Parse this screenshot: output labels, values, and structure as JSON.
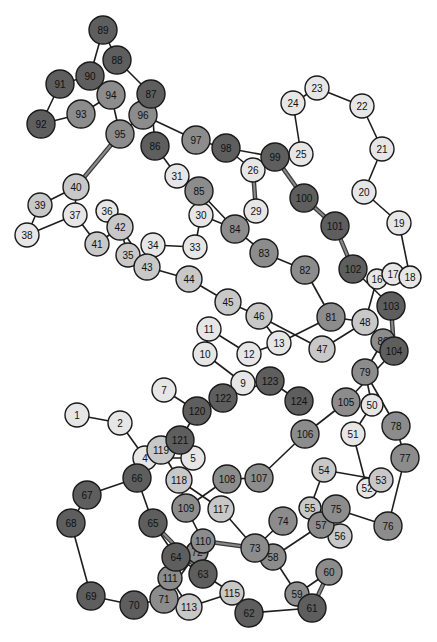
{
  "diagram": {
    "title": "",
    "shades": {
      "dark": "#5e5e5e",
      "medium": "#8c8c8c",
      "light": "#c8c8c8",
      "pale": "#e6e6e6"
    },
    "nodes": [
      {
        "id": "1",
        "x": 77,
        "y": 415,
        "r": 12,
        "shade": "pale"
      },
      {
        "id": "2",
        "x": 120,
        "y": 423,
        "r": 12,
        "shade": "pale"
      },
      {
        "id": "4",
        "x": 145,
        "y": 458,
        "r": 12,
        "shade": "pale"
      },
      {
        "id": "5",
        "x": 193,
        "y": 458,
        "r": 12,
        "shade": "pale"
      },
      {
        "id": "7",
        "x": 164,
        "y": 390,
        "r": 12,
        "shade": "pale"
      },
      {
        "id": "9",
        "x": 243,
        "y": 383,
        "r": 12,
        "shade": "pale"
      },
      {
        "id": "10",
        "x": 205,
        "y": 354,
        "r": 12,
        "shade": "pale"
      },
      {
        "id": "11",
        "x": 209,
        "y": 329,
        "r": 12,
        "shade": "pale"
      },
      {
        "id": "12",
        "x": 249,
        "y": 354,
        "r": 12,
        "shade": "pale"
      },
      {
        "id": "13",
        "x": 279,
        "y": 343,
        "r": 12,
        "shade": "pale"
      },
      {
        "id": "16",
        "x": 377,
        "y": 279,
        "r": 10,
        "shade": "pale"
      },
      {
        "id": "17",
        "x": 393,
        "y": 274,
        "r": 11,
        "shade": "pale"
      },
      {
        "id": "18",
        "x": 410,
        "y": 277,
        "r": 11,
        "shade": "pale"
      },
      {
        "id": "19",
        "x": 399,
        "y": 223,
        "r": 12,
        "shade": "pale"
      },
      {
        "id": "20",
        "x": 364,
        "y": 192,
        "r": 12,
        "shade": "pale"
      },
      {
        "id": "21",
        "x": 382,
        "y": 149,
        "r": 12,
        "shade": "pale"
      },
      {
        "id": "22",
        "x": 362,
        "y": 106,
        "r": 12,
        "shade": "pale"
      },
      {
        "id": "23",
        "x": 317,
        "y": 88,
        "r": 12,
        "shade": "pale"
      },
      {
        "id": "24",
        "x": 293,
        "y": 103,
        "r": 12,
        "shade": "pale"
      },
      {
        "id": "25",
        "x": 301,
        "y": 154,
        "r": 12,
        "shade": "pale"
      },
      {
        "id": "26",
        "x": 253,
        "y": 170,
        "r": 12,
        "shade": "pale"
      },
      {
        "id": "29",
        "x": 256,
        "y": 211,
        "r": 12,
        "shade": "pale"
      },
      {
        "id": "30",
        "x": 201,
        "y": 215,
        "r": 12,
        "shade": "pale"
      },
      {
        "id": "31",
        "x": 177,
        "y": 176,
        "r": 12,
        "shade": "pale"
      },
      {
        "id": "33",
        "x": 195,
        "y": 247,
        "r": 12,
        "shade": "pale"
      },
      {
        "id": "34",
        "x": 153,
        "y": 245,
        "r": 12,
        "shade": "pale"
      },
      {
        "id": "35",
        "x": 128,
        "y": 255,
        "r": 12,
        "shade": "light"
      },
      {
        "id": "36",
        "x": 107,
        "y": 211,
        "r": 11,
        "shade": "pale"
      },
      {
        "id": "37",
        "x": 75,
        "y": 215,
        "r": 12,
        "shade": "pale"
      },
      {
        "id": "38",
        "x": 27,
        "y": 235,
        "r": 12,
        "shade": "pale"
      },
      {
        "id": "39",
        "x": 40,
        "y": 205,
        "r": 12,
        "shade": "light"
      },
      {
        "id": "40",
        "x": 76,
        "y": 187,
        "r": 13,
        "shade": "light"
      },
      {
        "id": "41",
        "x": 97,
        "y": 244,
        "r": 12,
        "shade": "light"
      },
      {
        "id": "42",
        "x": 120,
        "y": 227,
        "r": 13,
        "shade": "light"
      },
      {
        "id": "43",
        "x": 147,
        "y": 267,
        "r": 13,
        "shade": "light"
      },
      {
        "id": "44",
        "x": 189,
        "y": 279,
        "r": 13,
        "shade": "light"
      },
      {
        "id": "45",
        "x": 228,
        "y": 302,
        "r": 13,
        "shade": "light"
      },
      {
        "id": "46",
        "x": 259,
        "y": 316,
        "r": 13,
        "shade": "light"
      },
      {
        "id": "47",
        "x": 322,
        "y": 349,
        "r": 13,
        "shade": "light"
      },
      {
        "id": "48",
        "x": 365,
        "y": 322,
        "r": 13,
        "shade": "light"
      },
      {
        "id": "50",
        "x": 372,
        "y": 405,
        "r": 11,
        "shade": "pale"
      },
      {
        "id": "51",
        "x": 353,
        "y": 434,
        "r": 12,
        "shade": "pale"
      },
      {
        "id": "52",
        "x": 367,
        "y": 488,
        "r": 10,
        "shade": "pale"
      },
      {
        "id": "53",
        "x": 381,
        "y": 480,
        "r": 12,
        "shade": "light"
      },
      {
        "id": "54",
        "x": 324,
        "y": 470,
        "r": 12,
        "shade": "light"
      },
      {
        "id": "55",
        "x": 310,
        "y": 508,
        "r": 11,
        "shade": "light"
      },
      {
        "id": "56",
        "x": 340,
        "y": 536,
        "r": 12,
        "shade": "light"
      },
      {
        "id": "57",
        "x": 321,
        "y": 525,
        "r": 13,
        "shade": "medium"
      },
      {
        "id": "58",
        "x": 273,
        "y": 557,
        "r": 13,
        "shade": "medium"
      },
      {
        "id": "59",
        "x": 297,
        "y": 594,
        "r": 12,
        "shade": "medium"
      },
      {
        "id": "60",
        "x": 329,
        "y": 572,
        "r": 13,
        "shade": "medium"
      },
      {
        "id": "61",
        "x": 312,
        "y": 608,
        "r": 14,
        "shade": "dark"
      },
      {
        "id": "62",
        "x": 249,
        "y": 613,
        "r": 14,
        "shade": "dark"
      },
      {
        "id": "63",
        "x": 203,
        "y": 574,
        "r": 14,
        "shade": "dark"
      },
      {
        "id": "64",
        "x": 176,
        "y": 557,
        "r": 14,
        "shade": "dark"
      },
      {
        "id": "65",
        "x": 153,
        "y": 523,
        "r": 14,
        "shade": "dark"
      },
      {
        "id": "66",
        "x": 137,
        "y": 478,
        "r": 14,
        "shade": "dark"
      },
      {
        "id": "67",
        "x": 87,
        "y": 495,
        "r": 14,
        "shade": "dark"
      },
      {
        "id": "68",
        "x": 71,
        "y": 523,
        "r": 14,
        "shade": "dark"
      },
      {
        "id": "69",
        "x": 91,
        "y": 596,
        "r": 14,
        "shade": "dark"
      },
      {
        "id": "70",
        "x": 134,
        "y": 605,
        "r": 14,
        "shade": "dark"
      },
      {
        "id": "71",
        "x": 164,
        "y": 599,
        "r": 14,
        "shade": "medium"
      },
      {
        "id": "72",
        "x": 197,
        "y": 552,
        "r": 11,
        "shade": "medium"
      },
      {
        "id": "73",
        "x": 255,
        "y": 548,
        "r": 14,
        "shade": "medium"
      },
      {
        "id": "74",
        "x": 283,
        "y": 521,
        "r": 14,
        "shade": "medium"
      },
      {
        "id": "75",
        "x": 336,
        "y": 509,
        "r": 14,
        "shade": "medium"
      },
      {
        "id": "76",
        "x": 388,
        "y": 526,
        "r": 14,
        "shade": "medium"
      },
      {
        "id": "77",
        "x": 405,
        "y": 458,
        "r": 14,
        "shade": "medium"
      },
      {
        "id": "78",
        "x": 396,
        "y": 426,
        "r": 14,
        "shade": "medium"
      },
      {
        "id": "79",
        "x": 365,
        "y": 372,
        "r": 13,
        "shade": "medium"
      },
      {
        "id": "80",
        "x": 383,
        "y": 341,
        "r": 12,
        "shade": "medium"
      },
      {
        "id": "81",
        "x": 331,
        "y": 317,
        "r": 14,
        "shade": "medium"
      },
      {
        "id": "82",
        "x": 305,
        "y": 270,
        "r": 14,
        "shade": "medium"
      },
      {
        "id": "83",
        "x": 264,
        "y": 253,
        "r": 14,
        "shade": "medium"
      },
      {
        "id": "84",
        "x": 235,
        "y": 229,
        "r": 14,
        "shade": "medium"
      },
      {
        "id": "85",
        "x": 199,
        "y": 191,
        "r": 14,
        "shade": "medium"
      },
      {
        "id": "86",
        "x": 155,
        "y": 146,
        "r": 14,
        "shade": "dark"
      },
      {
        "id": "87",
        "x": 151,
        "y": 94,
        "r": 14,
        "shade": "dark"
      },
      {
        "id": "88",
        "x": 117,
        "y": 60,
        "r": 14,
        "shade": "dark"
      },
      {
        "id": "89",
        "x": 103,
        "y": 30,
        "r": 14,
        "shade": "dark"
      },
      {
        "id": "90",
        "x": 90,
        "y": 76,
        "r": 14,
        "shade": "dark"
      },
      {
        "id": "91",
        "x": 60,
        "y": 84,
        "r": 14,
        "shade": "dark"
      },
      {
        "id": "92",
        "x": 41,
        "y": 124,
        "r": 14,
        "shade": "dark"
      },
      {
        "id": "93",
        "x": 81,
        "y": 114,
        "r": 14,
        "shade": "medium"
      },
      {
        "id": "94",
        "x": 111,
        "y": 95,
        "r": 14,
        "shade": "medium"
      },
      {
        "id": "95",
        "x": 120,
        "y": 134,
        "r": 14,
        "shade": "medium"
      },
      {
        "id": "96",
        "x": 143,
        "y": 115,
        "r": 14,
        "shade": "medium"
      },
      {
        "id": "97",
        "x": 196,
        "y": 140,
        "r": 14,
        "shade": "medium"
      },
      {
        "id": "98",
        "x": 226,
        "y": 148,
        "r": 14,
        "shade": "dark"
      },
      {
        "id": "99",
        "x": 275,
        "y": 157,
        "r": 14,
        "shade": "dark"
      },
      {
        "id": "100",
        "x": 304,
        "y": 198,
        "r": 14,
        "shade": "dark"
      },
      {
        "id": "101",
        "x": 335,
        "y": 226,
        "r": 14,
        "shade": "dark"
      },
      {
        "id": "102",
        "x": 353,
        "y": 269,
        "r": 14,
        "shade": "dark"
      },
      {
        "id": "103",
        "x": 391,
        "y": 306,
        "r": 14,
        "shade": "dark"
      },
      {
        "id": "104",
        "x": 394,
        "y": 351,
        "r": 14,
        "shade": "dark"
      },
      {
        "id": "105",
        "x": 346,
        "y": 402,
        "r": 14,
        "shade": "medium"
      },
      {
        "id": "106",
        "x": 305,
        "y": 434,
        "r": 14,
        "shade": "medium"
      },
      {
        "id": "107",
        "x": 259,
        "y": 478,
        "r": 14,
        "shade": "medium"
      },
      {
        "id": "108",
        "x": 227,
        "y": 479,
        "r": 14,
        "shade": "medium"
      },
      {
        "id": "109",
        "x": 186,
        "y": 508,
        "r": 14,
        "shade": "medium"
      },
      {
        "id": "110",
        "x": 203,
        "y": 541,
        "r": 12,
        "shade": "medium"
      },
      {
        "id": "111",
        "x": 170,
        "y": 578,
        "r": 12,
        "shade": "medium"
      },
      {
        "id": "113",
        "x": 189,
        "y": 607,
        "r": 13,
        "shade": "light"
      },
      {
        "id": "115",
        "x": 232,
        "y": 593,
        "r": 12,
        "shade": "light"
      },
      {
        "id": "117",
        "x": 221,
        "y": 509,
        "r": 13,
        "shade": "light"
      },
      {
        "id": "118",
        "x": 179,
        "y": 480,
        "r": 13,
        "shade": "light"
      },
      {
        "id": "119",
        "x": 161,
        "y": 450,
        "r": 14,
        "shade": "light"
      },
      {
        "id": "120",
        "x": 197,
        "y": 411,
        "r": 14,
        "shade": "dark"
      },
      {
        "id": "121",
        "x": 180,
        "y": 440,
        "r": 14,
        "shade": "dark"
      },
      {
        "id": "122",
        "x": 223,
        "y": 398,
        "r": 14,
        "shade": "dark"
      },
      {
        "id": "123",
        "x": 270,
        "y": 381,
        "r": 14,
        "shade": "dark"
      },
      {
        "id": "124",
        "x": 299,
        "y": 401,
        "r": 14,
        "shade": "dark"
      }
    ],
    "edges": [
      [
        "1",
        "2"
      ],
      [
        "2",
        "4"
      ],
      [
        "4",
        "5"
      ],
      [
        "5",
        "121"
      ],
      [
        "7",
        "120"
      ],
      [
        "9",
        "10"
      ],
      [
        "10",
        "11"
      ],
      [
        "11",
        "12"
      ],
      [
        "12",
        "13"
      ],
      [
        "13",
        "81"
      ],
      [
        "13",
        "46"
      ],
      [
        "16",
        "17"
      ],
      [
        "17",
        "18"
      ],
      [
        "18",
        "19"
      ],
      [
        "19",
        "20"
      ],
      [
        "20",
        "21"
      ],
      [
        "21",
        "22"
      ],
      [
        "22",
        "23"
      ],
      [
        "23",
        "24"
      ],
      [
        "24",
        "25"
      ],
      [
        "25",
        "99"
      ],
      [
        "26",
        "29"
      ],
      [
        "26",
        "98"
      ],
      [
        "29",
        "84"
      ],
      [
        "30",
        "33"
      ],
      [
        "30",
        "85"
      ],
      [
        "31",
        "85"
      ],
      [
        "31",
        "86"
      ],
      [
        "33",
        "34"
      ],
      [
        "34",
        "43"
      ],
      [
        "35",
        "42"
      ],
      [
        "36",
        "42"
      ],
      [
        "37",
        "38"
      ],
      [
        "37",
        "40"
      ],
      [
        "37",
        "41"
      ],
      [
        "38",
        "39"
      ],
      [
        "39",
        "40"
      ],
      [
        "41",
        "42"
      ],
      [
        "42",
        "43"
      ],
      [
        "43",
        "44"
      ],
      [
        "44",
        "45"
      ],
      [
        "45",
        "46"
      ],
      [
        "46",
        "47"
      ],
      [
        "47",
        "48"
      ],
      [
        "48",
        "16"
      ],
      [
        "48",
        "80"
      ],
      [
        "50",
        "51"
      ],
      [
        "50",
        "79"
      ],
      [
        "51",
        "52"
      ],
      [
        "52",
        "53"
      ],
      [
        "53",
        "54"
      ],
      [
        "54",
        "55"
      ],
      [
        "55",
        "57"
      ],
      [
        "56",
        "57"
      ],
      [
        "57",
        "75"
      ],
      [
        "57",
        "58"
      ],
      [
        "58",
        "59"
      ],
      [
        "59",
        "60"
      ],
      [
        "60",
        "61"
      ],
      [
        "61",
        "62"
      ],
      [
        "62",
        "115"
      ],
      [
        "63",
        "115"
      ],
      [
        "63",
        "72"
      ],
      [
        "64",
        "65"
      ],
      [
        "64",
        "63"
      ],
      [
        "65",
        "66"
      ],
      [
        "66",
        "67"
      ],
      [
        "66",
        "4"
      ],
      [
        "67",
        "68"
      ],
      [
        "68",
        "69"
      ],
      [
        "69",
        "70"
      ],
      [
        "70",
        "71"
      ],
      [
        "71",
        "72"
      ],
      [
        "71",
        "113"
      ],
      [
        "73",
        "58"
      ],
      [
        "73",
        "74"
      ],
      [
        "73",
        "110"
      ],
      [
        "73",
        "117"
      ],
      [
        "75",
        "76"
      ],
      [
        "76",
        "77"
      ],
      [
        "77",
        "78"
      ],
      [
        "78",
        "79"
      ],
      [
        "79",
        "80"
      ],
      [
        "80",
        "104"
      ],
      [
        "81",
        "82"
      ],
      [
        "81",
        "48"
      ],
      [
        "82",
        "83"
      ],
      [
        "83",
        "84"
      ],
      [
        "84",
        "85"
      ],
      [
        "84",
        "30"
      ],
      [
        "86",
        "87"
      ],
      [
        "87",
        "88"
      ],
      [
        "87",
        "96"
      ],
      [
        "88",
        "89"
      ],
      [
        "89",
        "90"
      ],
      [
        "90",
        "91"
      ],
      [
        "90",
        "94"
      ],
      [
        "91",
        "92"
      ],
      [
        "92",
        "93"
      ],
      [
        "93",
        "94"
      ],
      [
        "94",
        "95"
      ],
      [
        "95",
        "96"
      ],
      [
        "96",
        "97"
      ],
      [
        "97",
        "98"
      ],
      [
        "98",
        "99"
      ],
      [
        "99",
        "100"
      ],
      [
        "100",
        "101"
      ],
      [
        "101",
        "102"
      ],
      [
        "102",
        "103"
      ],
      [
        "103",
        "104"
      ],
      [
        "104",
        "105"
      ],
      [
        "105",
        "106"
      ],
      [
        "106",
        "107"
      ],
      [
        "107",
        "108"
      ],
      [
        "108",
        "109"
      ],
      [
        "109",
        "118"
      ],
      [
        "109",
        "110"
      ],
      [
        "110",
        "111"
      ],
      [
        "111",
        "113"
      ],
      [
        "113",
        "115"
      ],
      [
        "117",
        "118"
      ],
      [
        "118",
        "119"
      ],
      [
        "119",
        "121"
      ],
      [
        "120",
        "121"
      ],
      [
        "120",
        "122"
      ],
      [
        "122",
        "9"
      ],
      [
        "122",
        "123"
      ],
      [
        "123",
        "124"
      ],
      [
        "9",
        "123"
      ]
    ],
    "thick_edges": [
      [
        "95",
        "40"
      ],
      [
        "26",
        "29"
      ],
      [
        "99",
        "100"
      ],
      [
        "100",
        "101"
      ],
      [
        "101",
        "102"
      ],
      [
        "103",
        "104"
      ],
      [
        "65",
        "63"
      ],
      [
        "110",
        "73"
      ],
      [
        "60",
        "61"
      ]
    ]
  }
}
